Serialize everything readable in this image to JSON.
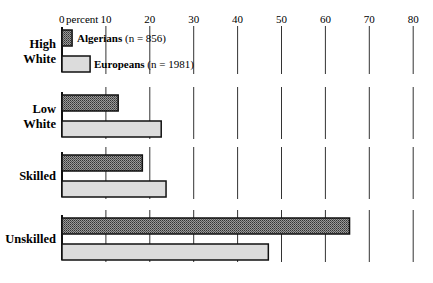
{
  "chart_data": {
    "type": "bar",
    "orientation": "horizontal",
    "title": "",
    "xlabel": "percent",
    "ylabel": "",
    "xlim": [
      0,
      80
    ],
    "xticks": [
      0,
      10,
      20,
      30,
      40,
      50,
      60,
      70,
      80
    ],
    "xtick_labels": [
      "0",
      "10",
      "20",
      "30",
      "40",
      "50",
      "60",
      "70",
      "80"
    ],
    "categories": [
      "High White",
      "Low White",
      "Skilled",
      "Unskilled"
    ],
    "category_lines": [
      [
        "High",
        "White"
      ],
      [
        "Low",
        "White"
      ],
      [
        "Skilled"
      ],
      [
        "Unskilled"
      ]
    ],
    "series": [
      {
        "name": "Algerians",
        "n_label": "(n = 856)",
        "pattern": "crosshatch",
        "values": [
          2.3,
          12.8,
          18.3,
          65.5
        ]
      },
      {
        "name": "Europeans",
        "n_label": "(n = 1981)",
        "pattern": "light-gray",
        "values": [
          6.4,
          22.6,
          23.7,
          47.0
        ]
      }
    ],
    "grid": "vertical lines at each tick",
    "legend_position": "inline next to first category bars"
  },
  "axis": {
    "zero_label": "0",
    "unit_label": "percent"
  }
}
